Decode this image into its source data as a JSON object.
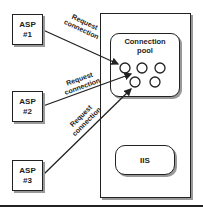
{
  "diagram": {
    "clients": [
      {
        "line1": "ASP",
        "line2": "#1"
      },
      {
        "line1": "ASP",
        "line2": "#2"
      },
      {
        "line1": "ASP",
        "line2": "#3"
      }
    ],
    "arrows": [
      {
        "label_line1": "Request",
        "label_line2": "connection"
      },
      {
        "label_line1": "Request",
        "label_line2": "connection"
      },
      {
        "label_line1": "Request",
        "label_line2": "connection"
      }
    ],
    "server": {
      "pool": {
        "title_line1": "Connection",
        "title_line2": "pool",
        "connection_count": 5
      },
      "iis_label": "IIS"
    },
    "colors": {
      "stroke": "#222222",
      "shadow": "#999999",
      "background": "#ffffff"
    }
  }
}
